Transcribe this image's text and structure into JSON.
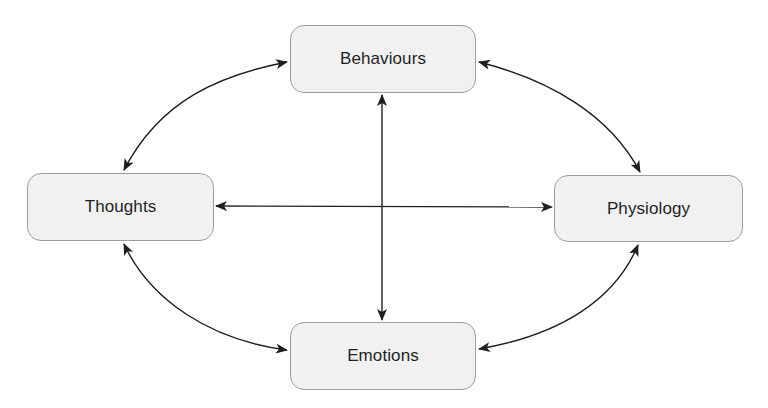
{
  "diagram": {
    "type": "cycle-with-cross-links",
    "colors": {
      "node_fill": "#f1f1f1",
      "node_border": "#9d9d9d",
      "arrow": "#1f1f1f",
      "text": "#1f1f1f",
      "background": "#ffffff"
    },
    "nodes": {
      "behaviours": {
        "label": "Behaviours"
      },
      "thoughts": {
        "label": "Thoughts"
      },
      "physiology": {
        "label": "Physiology"
      },
      "emotions": {
        "label": "Emotions"
      }
    },
    "edges": [
      {
        "from": "Behaviours",
        "to": "Thoughts",
        "style": "curved",
        "direction": "bidirectional"
      },
      {
        "from": "Behaviours",
        "to": "Physiology",
        "style": "curved",
        "direction": "bidirectional"
      },
      {
        "from": "Thoughts",
        "to": "Emotions",
        "style": "curved",
        "direction": "bidirectional"
      },
      {
        "from": "Physiology",
        "to": "Emotions",
        "style": "curved",
        "direction": "bidirectional"
      },
      {
        "from": "Behaviours",
        "to": "Emotions",
        "style": "straight",
        "direction": "bidirectional"
      },
      {
        "from": "Thoughts",
        "to": "Physiology",
        "style": "straight",
        "direction": "bidirectional"
      }
    ]
  }
}
